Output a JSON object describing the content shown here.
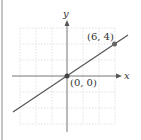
{
  "diagram": {
    "type": "coordinate-plane-line",
    "axes": {
      "x_label": "x",
      "y_label": "y"
    },
    "points": [
      {
        "label": "(0, 0)",
        "x": 0,
        "y": 0
      },
      {
        "label": "(6, 4)",
        "x": 6,
        "y": 4
      }
    ],
    "line": {
      "slope": 0.6667,
      "intercept": 0
    },
    "grid": {
      "xmin": -6,
      "xmax": 6,
      "ymin": -6,
      "ymax": 6,
      "step": 2,
      "style": "dotted"
    },
    "colors": {
      "line": "#555555",
      "axis": "#777777",
      "grid": "#dddddd",
      "point": "#444444",
      "frame": "#888888"
    }
  }
}
